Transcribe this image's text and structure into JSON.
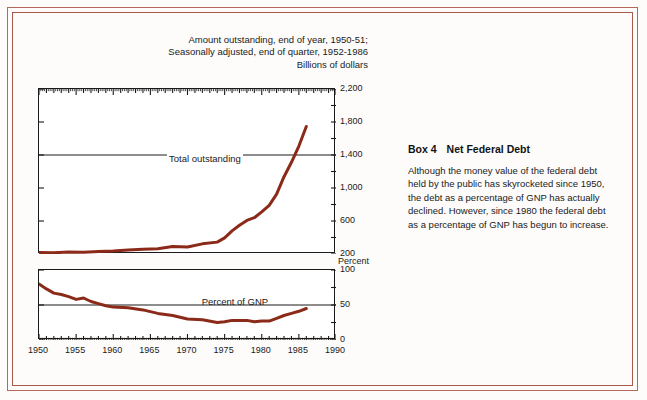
{
  "figure": {
    "title_lines": [
      "Amount outstanding, end of year, 1950-51;",
      "Seasonally adjusted, end of quarter, 1952-1986",
      "Billions of dollars"
    ],
    "top_unit_label": "Billions of dollars",
    "mid_unit_label": "Percent",
    "top_series_label": "Total outstanding",
    "bottom_series_label": "Percent of GNP",
    "line_color": "#8B2A18",
    "axis_color": "#1a1a1a",
    "frame_color": "#b5695a"
  },
  "box": {
    "label": "Box 4",
    "title": "Net Federal Debt",
    "body": "Although the money value of the federal debt held by the public has skyrocketed since 1950, the debt as a percentage of GNP has actually declined.  However, since 1980 the federal debt as a percentage of GNP has begun to increase."
  },
  "chart_data": [
    {
      "type": "line",
      "title": "Amount outstanding, end of year, 1950-51; Seasonally adjusted, end of quarter, 1952-1986",
      "subtitle": "Billions of dollars",
      "xlabel": "",
      "ylabel": "Billions of dollars",
      "series_name": "Total outstanding",
      "xlim": [
        1950,
        1990
      ],
      "ylim": [
        200,
        2200
      ],
      "yticks": [
        200,
        600,
        1000,
        1400,
        1800,
        2200
      ],
      "ytick_labels": [
        "200",
        "600",
        "1,000",
        "1,400",
        "1,800",
        "2,200"
      ],
      "xticks": [
        1950,
        1955,
        1960,
        1965,
        1970,
        1975,
        1980,
        1985,
        1990
      ],
      "xtick_labels": [
        "1950",
        "1955",
        "1960",
        "1965",
        "1970",
        "1975",
        "1980",
        "1985",
        "1990"
      ],
      "grid": true,
      "gridlines_y": [
        1400
      ],
      "legend": "none",
      "x": [
        1950,
        1952,
        1954,
        1956,
        1958,
        1960,
        1962,
        1964,
        1966,
        1968,
        1970,
        1972,
        1974,
        1975,
        1976,
        1977,
        1978,
        1979,
        1980,
        1981,
        1982,
        1983,
        1984,
        1985,
        1986
      ],
      "values": [
        219,
        215,
        224,
        222,
        231,
        237,
        249,
        258,
        264,
        290,
        284,
        323,
        344,
        396,
        480,
        549,
        607,
        640,
        711,
        789,
        925,
        1137,
        1312,
        1509,
        1746
      ]
    },
    {
      "type": "line",
      "title": "",
      "subtitle": "Percent",
      "xlabel": "",
      "ylabel": "Percent",
      "series_name": "Percent of GNP",
      "xlim": [
        1950,
        1990
      ],
      "ylim": [
        0,
        100
      ],
      "yticks": [
        0,
        50,
        100
      ],
      "ytick_labels": [
        "0",
        "50",
        "100"
      ],
      "xticks": [
        1950,
        1955,
        1960,
        1965,
        1970,
        1975,
        1980,
        1985,
        1990
      ],
      "xtick_labels": [
        "1950",
        "1955",
        "1960",
        "1965",
        "1970",
        "1975",
        "1980",
        "1985",
        "1990"
      ],
      "grid": true,
      "gridlines_y": [
        50
      ],
      "legend": "none",
      "x": [
        1950,
        1951,
        1952,
        1953,
        1954,
        1955,
        1956,
        1957,
        1958,
        1959,
        1960,
        1962,
        1964,
        1966,
        1968,
        1970,
        1972,
        1974,
        1975,
        1976,
        1977,
        1978,
        1979,
        1980,
        1981,
        1982,
        1983,
        1984,
        1985,
        1986
      ],
      "values": [
        80,
        73,
        67,
        65,
        62,
        58,
        60,
        55,
        52,
        49,
        47,
        46,
        43,
        38,
        35,
        30,
        29,
        25,
        26,
        28,
        28,
        28,
        26,
        27,
        27,
        31,
        35,
        38,
        41,
        45
      ]
    }
  ]
}
